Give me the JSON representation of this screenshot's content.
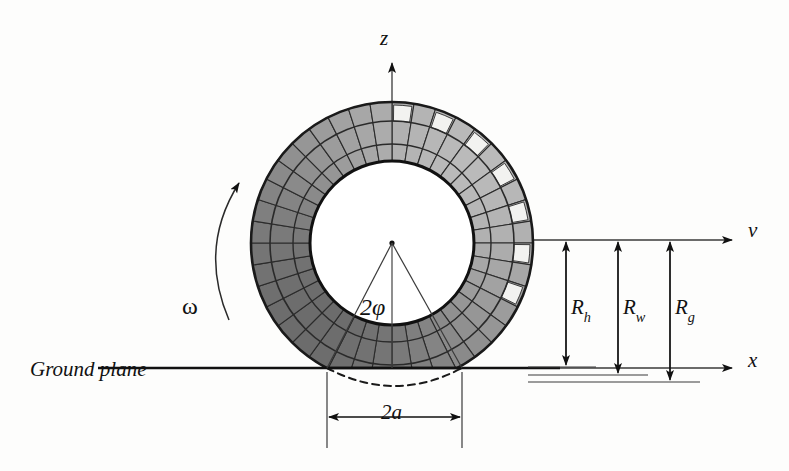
{
  "figure": {
    "background_color": "#fdfdfc",
    "line_color": "#111111",
    "tread_fill_dark": "#7d7d7d",
    "tread_fill_light": "#b5b5b5",
    "tread_highlight": "#f2f2f0"
  },
  "axes": {
    "z_label": "z",
    "v_label": "v",
    "x_label": "x",
    "origin": {
      "x": 392,
      "y": 243
    }
  },
  "labels": {
    "omega": "ω",
    "angle": "2φ",
    "ground_plane": "Ground plane",
    "contact_patch": "2a"
  },
  "radii": [
    {
      "name": "R_h",
      "symbol": "R",
      "subscript": "h",
      "x": 566,
      "top_y": 240,
      "bottom_y": 367
    },
    {
      "name": "R_w",
      "symbol": "R",
      "subscript": "w",
      "x": 618,
      "top_y": 240,
      "bottom_y": 375
    },
    {
      "name": "R_g",
      "symbol": "R",
      "subscript": "g",
      "x": 670,
      "top_y": 240,
      "bottom_y": 382
    }
  ],
  "tyre": {
    "center_x": 392,
    "center_y": 243,
    "outer_radius": 141,
    "inner_radius": 82,
    "segment_count": 40,
    "ground_y": 368,
    "contact_left_x": 327,
    "contact_right_x": 462
  },
  "contact_dimension": {
    "label": "2a",
    "left_x": 327,
    "right_x": 462,
    "y": 417
  }
}
